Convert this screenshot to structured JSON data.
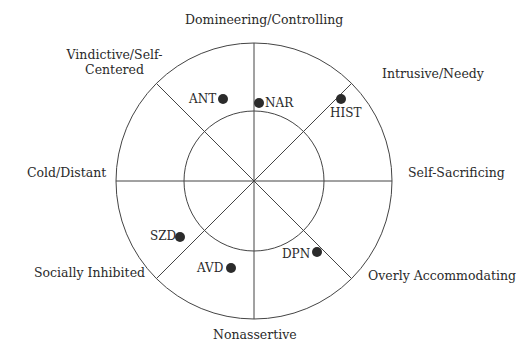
{
  "diagram": {
    "type": "interpersonal-circumplex",
    "octants": {
      "top": "Domineering/Controlling",
      "top_right": "Intrusive/Needy",
      "right": "Self-Sacrificing",
      "bottom_right": "Overly Accommodating",
      "bottom": "Nonassertive",
      "bottom_left": "Socially Inhibited",
      "left": "Cold/Distant",
      "top_left_line1": "Vindictive/Self-",
      "top_left_line2": "Centered"
    },
    "points": {
      "ant": "ANT",
      "nar": "NAR",
      "hist": "HIST",
      "szd": "SZD",
      "avd": "AVD",
      "dpn": "DPN"
    },
    "colors": {
      "line": "#444444",
      "dot": "#2b2b2b",
      "text": "#2a2a2a",
      "background": "#ffffff"
    }
  }
}
